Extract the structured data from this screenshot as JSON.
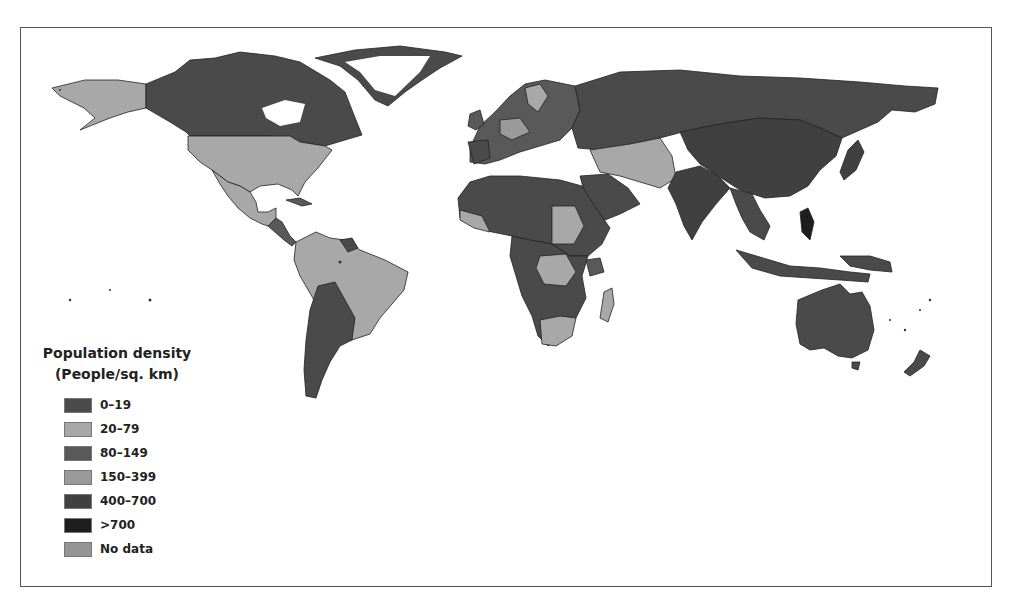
{
  "map": {
    "title": "Population density",
    "subtitle": "(People/sq. km)",
    "type": "choropleth world map",
    "colors": {
      "c0_19": "#4a4a4a",
      "c20_79": "#a8a8a8",
      "c80_149": "#595959",
      "c150_399": "#9a9a9a",
      "c400_700": "#404040",
      "c700": "#1e1e1e",
      "nodata": "#959595",
      "border": "#222222"
    }
  },
  "legend": {
    "title_line1": "Population density",
    "title_line2": "(People/sq. km)",
    "items": [
      {
        "label": "0–19",
        "color": "#4a4a4a"
      },
      {
        "label": "20–79",
        "color": "#a8a8a8"
      },
      {
        "label": "80–149",
        "color": "#595959"
      },
      {
        "label": "150–399",
        "color": "#9a9a9a"
      },
      {
        "label": "400–700",
        "color": "#404040"
      },
      {
        "label": ">700",
        "color": "#1e1e1e"
      },
      {
        "label": "No data",
        "color": "#959595"
      }
    ]
  }
}
